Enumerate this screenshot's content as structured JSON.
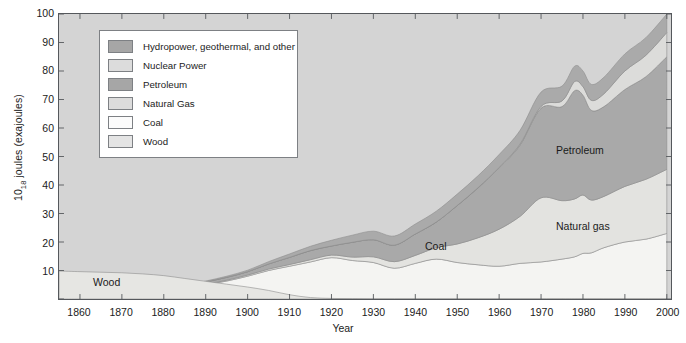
{
  "chart_data": {
    "type": "area",
    "title": "",
    "xlabel": "Year",
    "ylabel_main": "10",
    "ylabel_sub": "18",
    "ylabel_rest": " joules (exajoules)",
    "xlim": [
      1855,
      2001
    ],
    "ylim": [
      0,
      100
    ],
    "grid": false,
    "legend_position": "upper-left-inside",
    "xticks": [
      1860,
      1870,
      1880,
      1890,
      1900,
      1910,
      1920,
      1930,
      1940,
      1950,
      1960,
      1970,
      1980,
      1990,
      2000
    ],
    "yticks": [
      0,
      10,
      20,
      30,
      40,
      50,
      60,
      70,
      80,
      90,
      100
    ],
    "stack_order_bottom_to_top": [
      "Coal",
      "Natural Gas",
      "Petroleum",
      "Nuclear Power",
      "Hydropower, geothermal, and other",
      "Wood"
    ],
    "x": [
      1855,
      1860,
      1865,
      1870,
      1875,
      1880,
      1885,
      1890,
      1895,
      1900,
      1905,
      1910,
      1915,
      1920,
      1925,
      1930,
      1935,
      1940,
      1945,
      1950,
      1955,
      1960,
      1965,
      1970,
      1975,
      1978,
      1980,
      1982,
      1985,
      1990,
      1995,
      2000
    ],
    "series": [
      {
        "name": "Coal",
        "color": "#f4f4f2",
        "values": [
          0.4,
          0.6,
          0.9,
          1.3,
          2.0,
          2.7,
          3.8,
          5.0,
          6.3,
          8.0,
          10.0,
          11.5,
          13.0,
          14.5,
          13.5,
          12.8,
          10.8,
          12.5,
          14.0,
          12.8,
          12.0,
          11.5,
          12.5,
          13.0,
          14.0,
          14.8,
          16.0,
          16.2,
          18.0,
          20.0,
          21.0,
          23.0
        ]
      },
      {
        "name": "Natural Gas",
        "color": "#e3e3e0",
        "values": [
          0.0,
          0.0,
          0.0,
          0.0,
          0.0,
          0.0,
          0.1,
          0.2,
          0.3,
          0.4,
          0.5,
          0.6,
          0.8,
          0.9,
          1.2,
          2.0,
          2.3,
          2.8,
          4.0,
          6.5,
          9.5,
          13.0,
          16.5,
          22.5,
          20.5,
          20.3,
          20.5,
          18.5,
          18.0,
          19.5,
          21.0,
          22.5
        ]
      },
      {
        "name": "Petroleum",
        "color": "#a9a9a9",
        "values": [
          0.0,
          0.0,
          0.1,
          0.2,
          0.3,
          0.4,
          0.6,
          0.8,
          1.0,
          1.2,
          1.8,
          2.5,
          3.2,
          3.2,
          5.2,
          6.0,
          5.8,
          7.5,
          9.0,
          13.5,
          17.5,
          21.5,
          25.0,
          31.5,
          33.0,
          38.0,
          35.0,
          31.5,
          31.5,
          34.0,
          36.0,
          39.5
        ]
      },
      {
        "name": "Nuclear Power",
        "color": "#dcdcda",
        "values": [
          0.0,
          0.0,
          0.0,
          0.0,
          0.0,
          0.0,
          0.0,
          0.0,
          0.0,
          0.0,
          0.0,
          0.0,
          0.0,
          0.0,
          0.0,
          0.0,
          0.0,
          0.0,
          0.0,
          0.0,
          0.1,
          0.2,
          0.4,
          0.6,
          2.0,
          3.2,
          3.0,
          3.5,
          4.5,
          6.5,
          7.5,
          8.5
        ]
      },
      {
        "name": "Hydropower, geothermal, and other",
        "color": "#aaaaaa",
        "values": [
          0.0,
          0.0,
          0.0,
          0.0,
          0.0,
          0.1,
          0.2,
          0.3,
          0.4,
          0.5,
          0.8,
          1.2,
          1.5,
          2.0,
          2.5,
          3.0,
          3.2,
          3.5,
          3.8,
          4.0,
          4.2,
          4.5,
          4.8,
          5.0,
          5.2,
          5.4,
          5.5,
          5.6,
          5.8,
          6.0,
          6.2,
          6.5
        ]
      },
      {
        "name": "Wood",
        "color": "#e6e6e3",
        "values": [
          9.8,
          9.6,
          9.4,
          9.2,
          8.8,
          8.2,
          7.2,
          6.2,
          5.2,
          4.2,
          3.0,
          1.5,
          0.5,
          0.2,
          0.1,
          0.0,
          0.0,
          0.0,
          0.0,
          0.0,
          0.0,
          0.0,
          0.0,
          0.0,
          0.0,
          0.0,
          0.0,
          0.0,
          0.0,
          0.0,
          0.0,
          0.0
        ]
      }
    ],
    "annotations": [
      {
        "text": "Wood",
        "x_px": 93,
        "y_px": 276
      },
      {
        "text": "Coal",
        "x_px": 425,
        "y_px": 240
      },
      {
        "text": "Petroleum",
        "x_px": 556,
        "y_px": 144
      },
      {
        "text": "Natural gas",
        "x_px": 556,
        "y_px": 220
      }
    ]
  },
  "legend": {
    "items": [
      {
        "label": "Hydropower, geothermal, and other",
        "color": "#a6a6a6"
      },
      {
        "label": "Nuclear Power",
        "color": "#dcdcdc"
      },
      {
        "label": "Petroleum",
        "color": "#a6a6a6"
      },
      {
        "label": "Natural Gas",
        "color": "#dcdcdc"
      },
      {
        "label": "Coal",
        "color": "#fbfbfb"
      },
      {
        "label": "Wood",
        "color": "#e4e4e4"
      }
    ]
  },
  "colors": {
    "plot_background": "#d4d4d4",
    "axis_line": "#55585c",
    "text": "#1b1b1b"
  }
}
